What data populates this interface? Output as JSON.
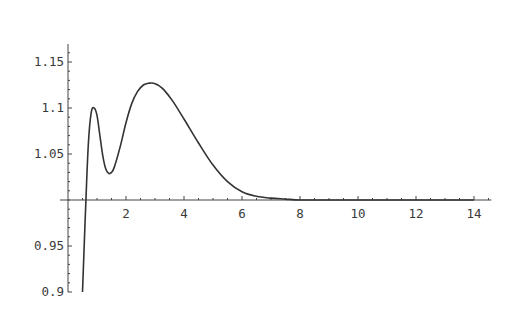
{
  "chart_data": {
    "type": "line",
    "title": "",
    "xlabel": "",
    "ylabel": "",
    "xlim": [
      0,
      14
    ],
    "ylim": [
      0.9,
      1.19
    ],
    "axes_origin": [
      0,
      1.0
    ],
    "grid": false,
    "legend": null,
    "x_ticks": [
      2,
      4,
      6,
      8,
      10,
      12,
      14
    ],
    "x_tick_labels": [
      "2",
      "4",
      "6",
      "8",
      "10",
      "12",
      "14"
    ],
    "y_ticks": [
      0.9,
      0.95,
      1.05,
      1.1,
      1.15
    ],
    "y_tick_labels": [
      "0.9",
      "0.95",
      "1.05",
      "1.1",
      "1.15"
    ],
    "series": [
      {
        "name": "f(x)",
        "color": "#333333",
        "x": [
          0.5,
          0.6,
          0.7,
          0.8,
          0.9,
          1.0,
          1.1,
          1.2,
          1.3,
          1.4,
          1.5,
          1.6,
          1.8,
          2.0,
          2.2,
          2.4,
          2.6,
          2.8,
          2.95,
          3.1,
          3.3,
          3.6,
          4.0,
          4.5,
          5.0,
          5.5,
          6.0,
          6.5,
          7.0,
          7.5,
          8.0,
          9.0,
          10.0,
          12.0,
          14.0
        ],
        "y": [
          0.9,
          0.985,
          1.06,
          1.095,
          1.1,
          1.092,
          1.07,
          1.048,
          1.034,
          1.029,
          1.03,
          1.036,
          1.058,
          1.084,
          1.105,
          1.118,
          1.125,
          1.127,
          1.127,
          1.125,
          1.12,
          1.108,
          1.088,
          1.062,
          1.038,
          1.02,
          1.009,
          1.004,
          1.002,
          1.001,
          1.0,
          1.0,
          1.0,
          1.0,
          1.0
        ]
      }
    ]
  }
}
